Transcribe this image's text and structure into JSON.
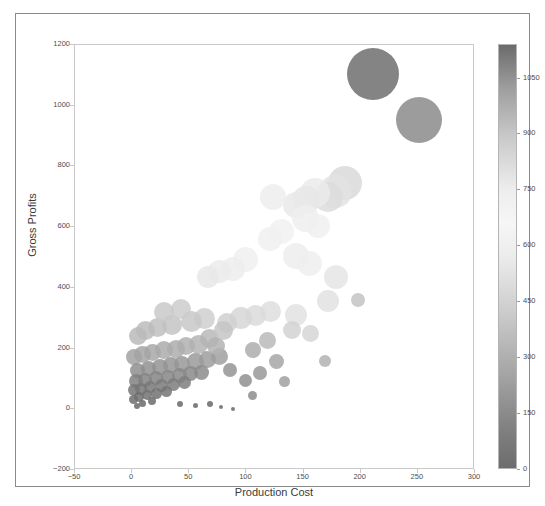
{
  "figure": {
    "background_color": "#ffffff",
    "frame_color": "#8a8a8a"
  },
  "chart_data": {
    "type": "scatter",
    "title": "",
    "xlabel": "Production Cost",
    "ylabel": "Gross Profits",
    "xlim": [
      -50,
      300
    ],
    "ylim": [
      -200,
      1200
    ],
    "xticks": [
      -50,
      0,
      50,
      100,
      150,
      200,
      250,
      300
    ],
    "xticklabels": [
      "−50",
      "0",
      "50",
      "100",
      "150",
      "200",
      "250",
      "300"
    ],
    "yticks": [
      -200,
      0,
      200,
      400,
      600,
      800,
      1000,
      1200
    ],
    "yticklabels": [
      "−200",
      "0",
      "200",
      "400",
      "600",
      "800",
      "1000",
      "1200"
    ],
    "grid": false,
    "legend": null,
    "marker": "circle",
    "size_encodes": "bubble area scales with magnitude",
    "color_encodes": "grayscale colormap keyed to colorbar value",
    "colorbar": {
      "ticks": [
        0,
        150,
        300,
        450,
        600,
        750,
        900,
        1050
      ],
      "ticklabels": [
        "0",
        "150",
        "300",
        "450",
        "600",
        "750",
        "900",
        "1050"
      ],
      "vmin": 0,
      "vmax": 1140,
      "orientation": "vertical",
      "position": "right",
      "colormap": "grayscale (dark at both ends, light near middle)",
      "stops": [
        {
          "pos": 0.0,
          "color": "#6d6d6d"
        },
        {
          "pos": 0.08,
          "color": "#7d7d7d"
        },
        {
          "pos": 0.22,
          "color": "#a4a4a4"
        },
        {
          "pos": 0.38,
          "color": "#cfcfcf"
        },
        {
          "pos": 0.5,
          "color": "#ececec"
        },
        {
          "pos": 0.58,
          "color": "#f6f6f6"
        },
        {
          "pos": 0.66,
          "color": "#ededed"
        },
        {
          "pos": 0.78,
          "color": "#cacaca"
        },
        {
          "pos": 0.9,
          "color": "#9d9d9d"
        },
        {
          "pos": 1.0,
          "color": "#6b6b6b"
        }
      ]
    },
    "points": [
      {
        "x": 211,
        "y": 1105,
        "size": 52,
        "color": "#6f6f6f"
      },
      {
        "x": 251,
        "y": 952,
        "size": 46,
        "color": "#8b8b8b"
      },
      {
        "x": 186,
        "y": 745,
        "size": 34,
        "color": "#d9d9d9"
      },
      {
        "x": 178,
        "y": 718,
        "size": 33,
        "color": "#e3e3e3"
      },
      {
        "x": 171,
        "y": 700,
        "size": 30,
        "color": "#dcdcdc"
      },
      {
        "x": 160,
        "y": 712,
        "size": 30,
        "color": "#ebebeb"
      },
      {
        "x": 152,
        "y": 690,
        "size": 28,
        "color": "#e6e6e6"
      },
      {
        "x": 143,
        "y": 672,
        "size": 26,
        "color": "#e9e9e9"
      },
      {
        "x": 123,
        "y": 700,
        "size": 26,
        "color": "#ededed"
      },
      {
        "x": 152,
        "y": 627,
        "size": 27,
        "color": "#eeeeee"
      },
      {
        "x": 163,
        "y": 605,
        "size": 24,
        "color": "#f0f0f0"
      },
      {
        "x": 131,
        "y": 587,
        "size": 25,
        "color": "#f1f1f1"
      },
      {
        "x": 121,
        "y": 560,
        "size": 24,
        "color": "#f0f0f0"
      },
      {
        "x": 143,
        "y": 505,
        "size": 26,
        "color": "#ededed"
      },
      {
        "x": 155,
        "y": 480,
        "size": 25,
        "color": "#eeeeee"
      },
      {
        "x": 99,
        "y": 492,
        "size": 25,
        "color": "#f0f0f0"
      },
      {
        "x": 88,
        "y": 463,
        "size": 24,
        "color": "#ededed"
      },
      {
        "x": 76,
        "y": 455,
        "size": 23,
        "color": "#ebebeb"
      },
      {
        "x": 66,
        "y": 437,
        "size": 22,
        "color": "#e8e8e8"
      },
      {
        "x": 178,
        "y": 435,
        "size": 24,
        "color": "#e5e5e5"
      },
      {
        "x": 171,
        "y": 358,
        "size": 22,
        "color": "#e2e2e2"
      },
      {
        "x": 143,
        "y": 312,
        "size": 22,
        "color": "#e2e2e2"
      },
      {
        "x": 121,
        "y": 322,
        "size": 21,
        "color": "#dedede"
      },
      {
        "x": 108,
        "y": 310,
        "size": 21,
        "color": "#dadada"
      },
      {
        "x": 95,
        "y": 300,
        "size": 22,
        "color": "#d6d6d6"
      },
      {
        "x": 83,
        "y": 283,
        "size": 20,
        "color": "#d0d0d0"
      },
      {
        "x": 63,
        "y": 300,
        "size": 21,
        "color": "#cfcfcf"
      },
      {
        "x": 52,
        "y": 290,
        "size": 21,
        "color": "#c8c8c8"
      },
      {
        "x": 35,
        "y": 278,
        "size": 20,
        "color": "#c4c4c4"
      },
      {
        "x": 22,
        "y": 268,
        "size": 19,
        "color": "#c0c0c0"
      },
      {
        "x": 12,
        "y": 258,
        "size": 19,
        "color": "#bcbcbc"
      },
      {
        "x": 5,
        "y": 240,
        "size": 18,
        "color": "#bababa"
      },
      {
        "x": 68,
        "y": 232,
        "size": 19,
        "color": "#b8b8b8"
      },
      {
        "x": 58,
        "y": 215,
        "size": 19,
        "color": "#b4b4b4"
      },
      {
        "x": 47,
        "y": 208,
        "size": 18,
        "color": "#b0b0b0"
      },
      {
        "x": 38,
        "y": 200,
        "size": 18,
        "color": "#adadad"
      },
      {
        "x": 28,
        "y": 195,
        "size": 18,
        "color": "#ababab"
      },
      {
        "x": 18,
        "y": 188,
        "size": 17,
        "color": "#a8a8a8"
      },
      {
        "x": 9,
        "y": 180,
        "size": 17,
        "color": "#a5a5a5"
      },
      {
        "x": 2,
        "y": 172,
        "size": 16,
        "color": "#a2a2a2"
      },
      {
        "x": 76,
        "y": 175,
        "size": 17,
        "color": "#a0a0a0"
      },
      {
        "x": 66,
        "y": 165,
        "size": 17,
        "color": "#9d9d9d"
      },
      {
        "x": 55,
        "y": 158,
        "size": 17,
        "color": "#9a9a9a"
      },
      {
        "x": 44,
        "y": 150,
        "size": 16,
        "color": "#989898"
      },
      {
        "x": 34,
        "y": 145,
        "size": 16,
        "color": "#959595"
      },
      {
        "x": 24,
        "y": 140,
        "size": 16,
        "color": "#939393"
      },
      {
        "x": 14,
        "y": 133,
        "size": 15,
        "color": "#919191"
      },
      {
        "x": 5,
        "y": 128,
        "size": 15,
        "color": "#8e8e8e"
      },
      {
        "x": 61,
        "y": 122,
        "size": 15,
        "color": "#8c8c8c"
      },
      {
        "x": 51,
        "y": 118,
        "size": 15,
        "color": "#8a8a8a"
      },
      {
        "x": 41,
        "y": 112,
        "size": 15,
        "color": "#888888"
      },
      {
        "x": 31,
        "y": 108,
        "size": 14,
        "color": "#868686"
      },
      {
        "x": 21,
        "y": 102,
        "size": 14,
        "color": "#848484"
      },
      {
        "x": 11,
        "y": 98,
        "size": 14,
        "color": "#828282"
      },
      {
        "x": 3,
        "y": 92,
        "size": 14,
        "color": "#808080"
      },
      {
        "x": 46,
        "y": 88,
        "size": 13,
        "color": "#7e7e7e"
      },
      {
        "x": 36,
        "y": 82,
        "size": 13,
        "color": "#7c7c7c"
      },
      {
        "x": 26,
        "y": 78,
        "size": 13,
        "color": "#7a7a7a"
      },
      {
        "x": 16,
        "y": 72,
        "size": 12,
        "color": "#787878"
      },
      {
        "x": 8,
        "y": 68,
        "size": 12,
        "color": "#777777"
      },
      {
        "x": 2,
        "y": 62,
        "size": 12,
        "color": "#757575"
      },
      {
        "x": 30,
        "y": 58,
        "size": 11,
        "color": "#747474"
      },
      {
        "x": 21,
        "y": 52,
        "size": 11,
        "color": "#727272"
      },
      {
        "x": 13,
        "y": 46,
        "size": 10,
        "color": "#717171"
      },
      {
        "x": 6,
        "y": 40,
        "size": 10,
        "color": "#6f6f6f"
      },
      {
        "x": 1,
        "y": 32,
        "size": 9,
        "color": "#6e6e6e"
      },
      {
        "x": 17,
        "y": 26,
        "size": 8,
        "color": "#6c6c6c"
      },
      {
        "x": 9,
        "y": 20,
        "size": 7,
        "color": "#6b6b6b"
      },
      {
        "x": 4,
        "y": 12,
        "size": 6,
        "color": "#6a6a6a"
      },
      {
        "x": 42,
        "y": 18,
        "size": 6,
        "color": "#6a6a6a"
      },
      {
        "x": 55,
        "y": 12,
        "size": 5,
        "color": "#696969"
      },
      {
        "x": 68,
        "y": 16,
        "size": 6,
        "color": "#686868"
      },
      {
        "x": 78,
        "y": 8,
        "size": 4,
        "color": "#686868"
      },
      {
        "x": 88,
        "y": 2,
        "size": 4,
        "color": "#676767"
      },
      {
        "x": 99,
        "y": 95,
        "size": 13,
        "color": "#8f8f8f"
      },
      {
        "x": 112,
        "y": 120,
        "size": 14,
        "color": "#999999"
      },
      {
        "x": 126,
        "y": 158,
        "size": 15,
        "color": "#a6a6a6"
      },
      {
        "x": 86,
        "y": 128,
        "size": 14,
        "color": "#949494"
      },
      {
        "x": 73,
        "y": 208,
        "size": 18,
        "color": "#b3b3b3"
      },
      {
        "x": 106,
        "y": 196,
        "size": 16,
        "color": "#adadad"
      },
      {
        "x": 118,
        "y": 228,
        "size": 17,
        "color": "#bababa"
      },
      {
        "x": 80,
        "y": 260,
        "size": 19,
        "color": "#c6c6c6"
      },
      {
        "x": 43,
        "y": 330,
        "size": 20,
        "color": "#cdcdcd"
      },
      {
        "x": 28,
        "y": 322,
        "size": 20,
        "color": "#c9c9c9"
      },
      {
        "x": 140,
        "y": 260,
        "size": 18,
        "color": "#d2d2d2"
      },
      {
        "x": 156,
        "y": 250,
        "size": 17,
        "color": "#d6d6d6"
      },
      {
        "x": 198,
        "y": 360,
        "size": 14,
        "color": "#c3c3c3"
      },
      {
        "x": 169,
        "y": 160,
        "size": 12,
        "color": "#b1b1b1"
      },
      {
        "x": 133,
        "y": 92,
        "size": 11,
        "color": "#a0a0a0"
      },
      {
        "x": 105,
        "y": 46,
        "size": 9,
        "color": "#8d8d8d"
      }
    ]
  }
}
